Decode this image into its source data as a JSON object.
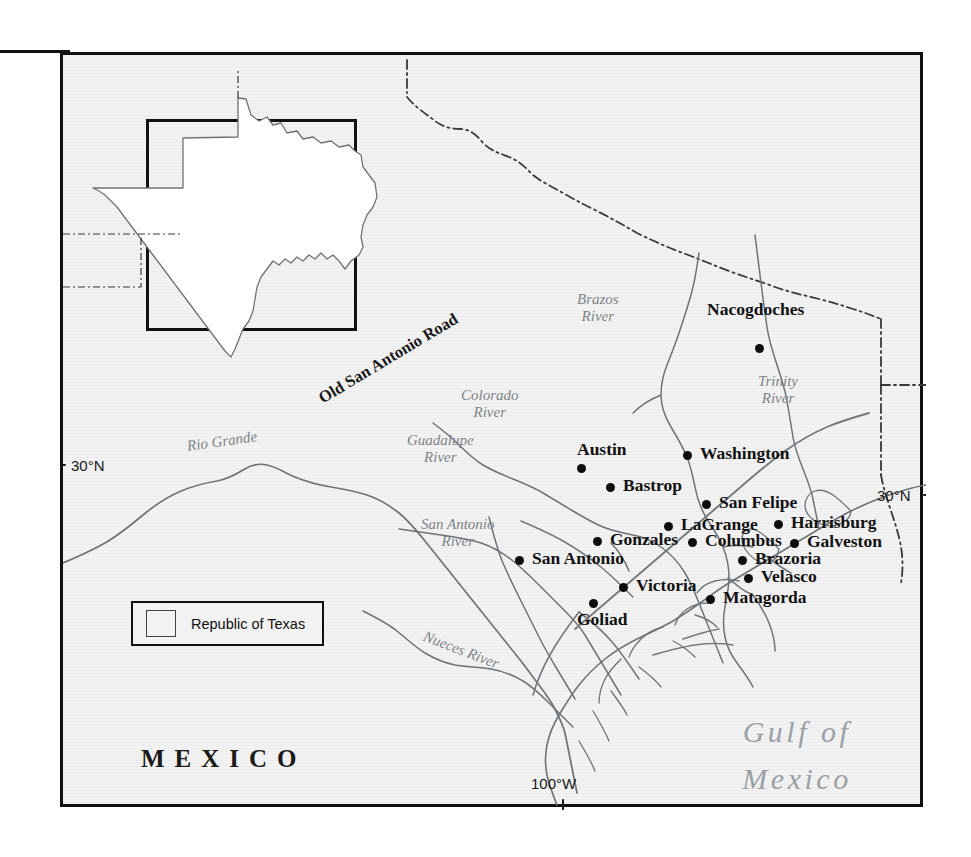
{
  "map": {
    "inset_title": "TEXAS",
    "region_labels": [
      {
        "name": "mexico",
        "text": "MEXICO"
      },
      {
        "name": "gulf-of-mexico",
        "line1": "Gulf of",
        "line2": "Mexico"
      }
    ],
    "legend": {
      "label": "Republic of Texas",
      "swatch_fill": "#f2f2f2",
      "swatch_stroke": "#444444"
    },
    "graticule": [
      {
        "name": "latitude-30n-left",
        "text": "30°N",
        "side": "left"
      },
      {
        "name": "latitude-30n-right",
        "text": "30°N",
        "side": "right"
      },
      {
        "name": "longitude-100w",
        "text": "100°W",
        "side": "bottom"
      }
    ],
    "cities": [
      {
        "name": "nacogdoches",
        "label": "Nacogdoches",
        "x": 756,
        "y": 345,
        "lx": 704,
        "ly": 298,
        "anchor": "left"
      },
      {
        "name": "austin",
        "label": "Austin",
        "x": 578,
        "y": 465,
        "lx": 574,
        "ly": 438,
        "anchor": "left"
      },
      {
        "name": "washington",
        "label": "Washington",
        "x": 684,
        "y": 452,
        "lx": 697,
        "ly": 442,
        "anchor": "left"
      },
      {
        "name": "bastrop",
        "label": "Bastrop",
        "x": 607,
        "y": 484,
        "lx": 620,
        "ly": 474,
        "anchor": "left"
      },
      {
        "name": "san-felipe",
        "label": "San Felipe",
        "x": 703,
        "y": 501,
        "lx": 716,
        "ly": 491,
        "anchor": "left"
      },
      {
        "name": "lagrange",
        "label": "LaGrange",
        "x": 665,
        "y": 523,
        "lx": 678,
        "ly": 513,
        "anchor": "left"
      },
      {
        "name": "harrisburg",
        "label": "Harrisburg",
        "x": 775,
        "y": 521,
        "lx": 788,
        "ly": 511,
        "anchor": "left"
      },
      {
        "name": "gonzales",
        "label": "Gonzales",
        "x": 594,
        "y": 538,
        "lx": 607,
        "ly": 528,
        "anchor": "left"
      },
      {
        "name": "columbus",
        "label": "Columbus",
        "x": 689,
        "y": 539,
        "lx": 702,
        "ly": 529,
        "anchor": "left"
      },
      {
        "name": "galveston",
        "label": "Galveston",
        "x": 791,
        "y": 540,
        "lx": 804,
        "ly": 530,
        "anchor": "left"
      },
      {
        "name": "san-antonio",
        "label": "San Antonio",
        "x": 516,
        "y": 557,
        "lx": 529,
        "ly": 547,
        "anchor": "left"
      },
      {
        "name": "brazoria",
        "label": "Brazoria",
        "x": 739,
        "y": 557,
        "lx": 752,
        "ly": 547,
        "anchor": "left"
      },
      {
        "name": "velasco",
        "label": "Velasco",
        "x": 745,
        "y": 575,
        "lx": 758,
        "ly": 565,
        "anchor": "left"
      },
      {
        "name": "victoria",
        "label": "Victoria",
        "x": 620,
        "y": 584,
        "lx": 633,
        "ly": 574,
        "anchor": "left"
      },
      {
        "name": "matagorda",
        "label": "Matagorda",
        "x": 707,
        "y": 596,
        "lx": 720,
        "ly": 586,
        "anchor": "left"
      },
      {
        "name": "goliad",
        "label": "Goliad",
        "x": 590,
        "y": 600,
        "lx": 574,
        "ly": 608,
        "anchor": "left"
      }
    ],
    "hydronyms": [
      {
        "name": "brazos-river",
        "line1": "Brazos",
        "line2": "River",
        "x": 574,
        "y": 293,
        "rot": 0
      },
      {
        "name": "trinity-river",
        "line1": "Trinity",
        "line2": "River",
        "x": 755,
        "y": 375,
        "rot": 0
      },
      {
        "name": "colorado-river",
        "line1": "Colorado",
        "line2": "River",
        "x": 458,
        "y": 389,
        "rot": 0
      },
      {
        "name": "guadalupe-river",
        "line1": "Guadalupe",
        "line2": "River",
        "x": 404,
        "y": 434,
        "rot": 0
      },
      {
        "name": "san-antonio-river",
        "line1": "San Antonio",
        "line2": "River",
        "x": 418,
        "y": 518,
        "rot": 0
      },
      {
        "name": "rio-grande",
        "line1": "Rio Grande",
        "line2": "",
        "x": 183,
        "y": 440,
        "rot": -8
      },
      {
        "name": "nueces-river",
        "line1": "Nueces River",
        "line2": "",
        "x": 424,
        "y": 630,
        "rot": 21
      }
    ],
    "roads": [
      {
        "name": "old-san-antonio-road",
        "label": "Old San Antonio Road",
        "x": 608,
        "y": 398,
        "rot": -31
      }
    ]
  }
}
